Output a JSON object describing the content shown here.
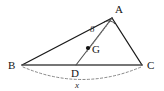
{
  "figure": {
    "width": 164,
    "height": 91,
    "background_color": "#ffffff"
  },
  "points": {
    "A": {
      "label": "A",
      "x": 112,
      "y": 18,
      "label_x": 115,
      "label_y": 13
    },
    "B": {
      "label": "B",
      "x": 22,
      "y": 65,
      "label_x": 10,
      "label_y": 69
    },
    "C": {
      "label": "C",
      "x": 142,
      "y": 65,
      "label_x": 148,
      "label_y": 69
    },
    "D": {
      "label": "D",
      "x": 76,
      "y": 65,
      "label_x": 73,
      "label_y": 78
    },
    "G": {
      "label": "G",
      "x": 88,
      "y": 48,
      "label_x": 93,
      "label_y": 53
    }
  },
  "segments": {
    "AB": {
      "name": "side-ab",
      "style": "solid"
    },
    "AC": {
      "name": "side-ac",
      "style": "solid"
    },
    "BC": {
      "name": "side-bc",
      "style": "solid"
    },
    "AD": {
      "name": "cevian-ad",
      "style": "solid"
    },
    "A_to_foot": {
      "name": "altitude-dotted",
      "style": "dotted"
    },
    "arc_BC": {
      "name": "arc-bc",
      "style": "dashed"
    }
  },
  "labels": {
    "length_8": "8",
    "length_x": "x",
    "length_8_x": 92,
    "length_8_y": 30,
    "length_x_x": 77,
    "length_x_y": 88
  },
  "colors": {
    "stroke_dark": "#1a1a1a",
    "stroke_medium": "#4a4a4a",
    "stroke_light": "#7a7a7a",
    "text": "#151515"
  }
}
